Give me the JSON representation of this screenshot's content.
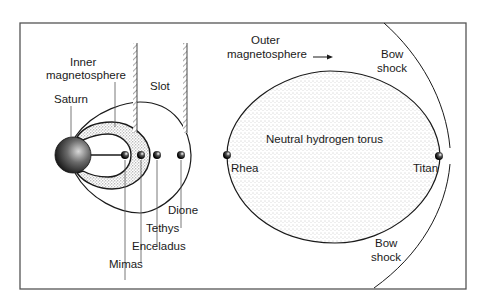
{
  "diagram": {
    "labels": {
      "saturn": "Saturn",
      "inner_line1": "Inner",
      "inner_line2": "magnetosphere",
      "slot": "Slot",
      "outer_line1": "Outer",
      "outer_line2": "magnetosphere",
      "bow_top_line1": "Bow",
      "bow_top_line2": "shock",
      "bow_bottom_line1": "Bow",
      "bow_bottom_line2": "shock",
      "torus": "Neutral hydrogen torus"
    },
    "moons": [
      {
        "name": "Mimas"
      },
      {
        "name": "Enceladus"
      },
      {
        "name": "Tethys"
      },
      {
        "name": "Dione"
      },
      {
        "name": "Rhea"
      },
      {
        "name": "Titan"
      }
    ],
    "colors": {
      "line": "#1a1a1a",
      "frame": "#555555",
      "stipple": "#9a9a9a",
      "background": "#ffffff"
    }
  }
}
